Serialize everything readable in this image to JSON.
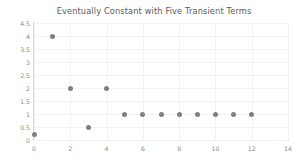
{
  "chart_data": {
    "type": "scatter",
    "title": "Eventually Constant with Five Transient Terms",
    "xlabel": "",
    "ylabel": "",
    "x": [
      0,
      1,
      2,
      3,
      4,
      5,
      6,
      7,
      8,
      9,
      10,
      11,
      12
    ],
    "values": [
      0.2,
      4,
      2,
      0.5,
      2,
      1,
      1,
      1,
      1,
      1,
      1,
      1,
      1
    ],
    "xlim": [
      0,
      14
    ],
    "ylim": [
      0,
      4.5
    ],
    "xticks": [
      0,
      2,
      4,
      6,
      8,
      10,
      12,
      14
    ],
    "xtick_labels": [
      "0",
      "2",
      "4",
      "6",
      "8",
      "10",
      "12",
      "14"
    ],
    "yticks": [
      0,
      0.5,
      1,
      1.5,
      2,
      2.5,
      3,
      3.5,
      4,
      4.5
    ],
    "ytick_labels": [
      "0",
      "0.5",
      "1",
      "1.5",
      "2",
      "2.5",
      "3",
      "3.5",
      "4",
      "4.5"
    ],
    "grid": true,
    "legend": false,
    "marker_color": "#808084",
    "grid_color": "#f2f2f2",
    "axis_color": "#d8d8d8",
    "title_color": "#5a5a5a",
    "tick_color": "#8a8a8a",
    "background_color": "#ffffff"
  }
}
